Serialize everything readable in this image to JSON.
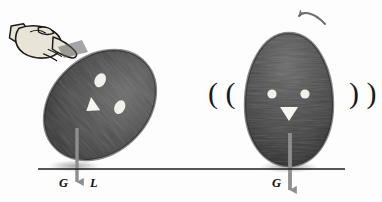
{
  "figure": {
    "background_color": "#fdfdfd",
    "ground_line_color": "#1c1c1c",
    "egg_body_color": "#4a4a4a",
    "egg_shadow_color": "#2b2b2b",
    "egg_feature_color": "#f2f0ea",
    "force_arrow_color": "#8e8e8e",
    "hand_fill_color": "#e8e4d8",
    "hand_outline_color": "#1a1a1a",
    "motion_arrow_color": "#6e6e6e"
  },
  "left_panel": {
    "name": "tilted-egg-panel",
    "description": "Egg tilted by a pushing hand, weight G acts through contact point with lever arm L",
    "egg_tilt_degrees": 47,
    "icons": {
      "hand": "pointing-hand-icon"
    },
    "labels": {
      "weight": "G",
      "lever_arm": "L"
    },
    "arrows": {
      "weight_arrow": "down-arrow-icon"
    }
  },
  "right_panel": {
    "name": "upright-egg-panel",
    "description": "Egg upright and wobbling back, weight G acts straight down through base",
    "egg_tilt_degrees": 0,
    "icons": {
      "rotation": "curved-arrow-counterclockwise-icon"
    },
    "labels": {
      "weight": "G",
      "wobble_left": "( (",
      "wobble_right": ") )"
    },
    "arrows": {
      "weight_arrow": "down-arrow-icon",
      "restoring_rotation_arrow": "curved-arrow-icon"
    }
  }
}
